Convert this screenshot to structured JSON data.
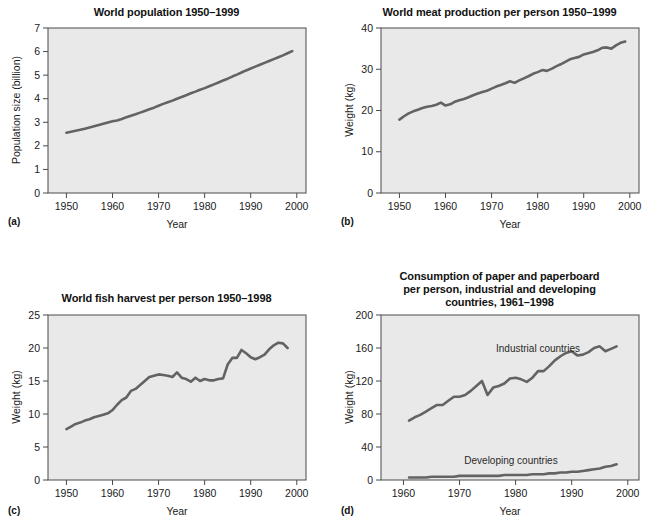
{
  "figure": {
    "background": "#ffffff",
    "plot_background": "#e9e9e9",
    "line_color": "#636363",
    "axis_color": "#4a4a4a",
    "text_color": "#1a1a1a"
  },
  "panels": {
    "a": {
      "letter": "(a)",
      "title": "World population 1950–1999",
      "xlabel": "Year",
      "ylabel": "Population size (billion)"
    },
    "b": {
      "letter": "(b)",
      "title": "World meat production per person 1950–1999",
      "xlabel": "Year",
      "ylabel": "Weight (kg)"
    },
    "c": {
      "letter": "(c)",
      "title": "World fish harvest per person 1950–1998",
      "xlabel": "Year",
      "ylabel": "Weight (kg)"
    },
    "d": {
      "letter": "(d)",
      "title_line1": "Consumption of paper and paperboard",
      "title_line2": "per person, industrial and developing",
      "title_line3": "countries, 1961–1998",
      "xlabel": "Year",
      "ylabel": "Weight (kg)",
      "annotation_industrial": "Industrial countries",
      "annotation_developing": "Developing countries"
    }
  },
  "chart_data": [
    {
      "id": "a",
      "type": "line",
      "title": "World population 1950–1999",
      "xlabel": "Year",
      "ylabel": "Population size (billion)",
      "xlim": [
        1946,
        2002
      ],
      "ylim": [
        0,
        7
      ],
      "xticks": [
        1950,
        1960,
        1970,
        1980,
        1990,
        2000
      ],
      "yticks": [
        0,
        1,
        2,
        3,
        4,
        5,
        6,
        7
      ],
      "grid": false,
      "legend": "none",
      "x": [
        1950,
        1951,
        1952,
        1953,
        1954,
        1955,
        1956,
        1957,
        1958,
        1959,
        1960,
        1961,
        1962,
        1963,
        1964,
        1965,
        1966,
        1967,
        1968,
        1969,
        1970,
        1971,
        1972,
        1973,
        1974,
        1975,
        1976,
        1977,
        1978,
        1979,
        1980,
        1981,
        1982,
        1983,
        1984,
        1985,
        1986,
        1987,
        1988,
        1989,
        1990,
        1991,
        1992,
        1993,
        1994,
        1995,
        1996,
        1997,
        1998,
        1999
      ],
      "series": [
        {
          "name": "World population",
          "values": [
            2.56,
            2.6,
            2.64,
            2.68,
            2.73,
            2.78,
            2.83,
            2.88,
            2.94,
            2.99,
            3.04,
            3.08,
            3.14,
            3.21,
            3.28,
            3.34,
            3.41,
            3.48,
            3.55,
            3.62,
            3.7,
            3.78,
            3.85,
            3.92,
            4.0,
            4.07,
            4.15,
            4.23,
            4.3,
            4.38,
            4.45,
            4.53,
            4.61,
            4.69,
            4.77,
            4.85,
            4.94,
            5.02,
            5.11,
            5.2,
            5.28,
            5.36,
            5.44,
            5.52,
            5.6,
            5.68,
            5.76,
            5.84,
            5.93,
            6.02
          ]
        }
      ]
    },
    {
      "id": "b",
      "type": "line",
      "title": "World meat production per person 1950–1999",
      "xlabel": "Year",
      "ylabel": "Weight (kg)",
      "xlim": [
        1946,
        2002
      ],
      "ylim": [
        0,
        40
      ],
      "xticks": [
        1950,
        1960,
        1970,
        1980,
        1990,
        2000
      ],
      "yticks": [
        0,
        10,
        20,
        30,
        40
      ],
      "grid": false,
      "legend": "none",
      "x": [
        1950,
        1951,
        1952,
        1953,
        1954,
        1955,
        1956,
        1957,
        1958,
        1959,
        1960,
        1961,
        1962,
        1963,
        1964,
        1965,
        1966,
        1967,
        1968,
        1969,
        1970,
        1971,
        1972,
        1973,
        1974,
        1975,
        1976,
        1977,
        1978,
        1979,
        1980,
        1981,
        1982,
        1983,
        1984,
        1985,
        1986,
        1987,
        1988,
        1989,
        1990,
        1991,
        1992,
        1993,
        1994,
        1995,
        1996,
        1997,
        1998,
        1999
      ],
      "series": [
        {
          "name": "Meat production per person",
          "values": [
            17.8,
            18.6,
            19.3,
            19.8,
            20.2,
            20.6,
            20.9,
            21.1,
            21.4,
            21.9,
            21.2,
            21.5,
            22.1,
            22.5,
            22.8,
            23.2,
            23.7,
            24.1,
            24.5,
            24.8,
            25.3,
            25.8,
            26.2,
            26.6,
            27.1,
            26.7,
            27.3,
            27.8,
            28.3,
            28.9,
            29.3,
            29.8,
            29.6,
            30.1,
            30.7,
            31.2,
            31.8,
            32.4,
            32.7,
            33.0,
            33.6,
            33.9,
            34.2,
            34.6,
            35.2,
            35.3,
            35.0,
            35.8,
            36.4,
            36.7
          ]
        }
      ]
    },
    {
      "id": "c",
      "type": "line",
      "title": "World fish harvest per person 1950–1998",
      "xlabel": "Year",
      "ylabel": "Weight (kg)",
      "xlim": [
        1946,
        2002
      ],
      "ylim": [
        0,
        25
      ],
      "xticks": [
        1950,
        1960,
        1970,
        1980,
        1990,
        2000
      ],
      "yticks": [
        0,
        5,
        10,
        15,
        20,
        25
      ],
      "grid": false,
      "legend": "none",
      "x": [
        1950,
        1951,
        1952,
        1953,
        1954,
        1955,
        1956,
        1957,
        1958,
        1959,
        1960,
        1961,
        1962,
        1963,
        1964,
        1965,
        1966,
        1967,
        1968,
        1969,
        1970,
        1971,
        1972,
        1973,
        1974,
        1975,
        1976,
        1977,
        1978,
        1979,
        1980,
        1981,
        1982,
        1983,
        1984,
        1985,
        1986,
        1987,
        1988,
        1989,
        1990,
        1991,
        1992,
        1993,
        1994,
        1995,
        1996,
        1997,
        1998
      ],
      "series": [
        {
          "name": "Fish harvest per person",
          "values": [
            7.7,
            8.1,
            8.5,
            8.7,
            9.0,
            9.2,
            9.5,
            9.7,
            9.9,
            10.1,
            10.6,
            11.4,
            12.1,
            12.5,
            13.5,
            13.8,
            14.4,
            15.0,
            15.6,
            15.8,
            16.0,
            15.9,
            15.8,
            15.6,
            16.3,
            15.5,
            15.3,
            14.9,
            15.5,
            15.0,
            15.3,
            15.1,
            15.1,
            15.3,
            15.4,
            17.5,
            18.5,
            18.5,
            19.7,
            19.2,
            18.6,
            18.3,
            18.6,
            19.0,
            19.8,
            20.4,
            20.8,
            20.7,
            20.0
          ]
        }
      ]
    },
    {
      "id": "d",
      "type": "line",
      "title": "Consumption of paper and paperboard per person, industrial and developing countries, 1961–1998",
      "xlabel": "Year",
      "ylabel": "Weight (kg)",
      "xlim": [
        1956,
        2002
      ],
      "ylim": [
        0,
        200
      ],
      "xticks": [
        1960,
        1970,
        1980,
        1990,
        2000
      ],
      "yticks": [
        0,
        40,
        80,
        120,
        160,
        200
      ],
      "grid": false,
      "legend": "inline-annotation",
      "x": [
        1961,
        1962,
        1963,
        1964,
        1965,
        1966,
        1967,
        1968,
        1969,
        1970,
        1971,
        1972,
        1973,
        1974,
        1975,
        1976,
        1977,
        1978,
        1979,
        1980,
        1981,
        1982,
        1983,
        1984,
        1985,
        1986,
        1987,
        1988,
        1989,
        1990,
        1991,
        1992,
        1993,
        1994,
        1995,
        1996,
        1997,
        1998
      ],
      "series": [
        {
          "name": "Industrial countries",
          "values": [
            72,
            76,
            79,
            83,
            87,
            91,
            91,
            96,
            101,
            101,
            103,
            108,
            114,
            120,
            103,
            112,
            114,
            117,
            123,
            124,
            122,
            119,
            124,
            132,
            132,
            138,
            145,
            150,
            154,
            156,
            151,
            152,
            155,
            160,
            162,
            156,
            159,
            162
          ]
        },
        {
          "name": "Developing countries",
          "values": [
            3,
            3,
            3,
            3,
            4,
            4,
            4,
            4,
            4,
            5,
            5,
            5,
            5,
            5,
            5,
            5,
            5,
            6,
            6,
            6,
            6,
            6,
            7,
            7,
            7,
            8,
            8,
            9,
            9,
            10,
            10,
            11,
            12,
            13,
            14,
            16,
            17,
            19
          ]
        }
      ]
    }
  ]
}
